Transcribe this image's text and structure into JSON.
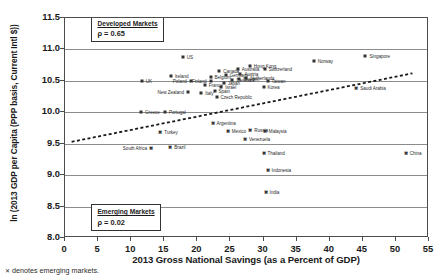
{
  "chart_data": {
    "type": "scatter",
    "title": "",
    "xlabel": "2013 Gross National Savings (as a Percent of GDP)",
    "ylabel": "ln (2013 GDP per Capita (PPP basis, Current Intl $))",
    "xlim": [
      0,
      55
    ],
    "ylim": [
      8.0,
      11.5
    ],
    "xticks": [
      "0",
      "5",
      "10",
      "15",
      "20",
      "25",
      "30",
      "35",
      "40",
      "45",
      "50",
      "55"
    ],
    "yticks": [
      "8.0",
      "8.5",
      "9.0",
      "9.5",
      "10.0",
      "10.5",
      "11.0",
      "11.5"
    ],
    "grid": "horizontal",
    "legend_position": "none",
    "trendline": {
      "style": "dashed",
      "x0": 1.0,
      "y0": 9.53,
      "x1": 52.5,
      "y1": 10.62
    },
    "annotations": [
      {
        "name": "developed-markets",
        "title": "Developed Markets",
        "rho": "ρ = 0.65",
        "x": 4.0,
        "y": 11.44
      },
      {
        "name": "emerging-markets",
        "title": "Emerging Markets",
        "rho": "ρ = 0.02",
        "x": 4.0,
        "y": 8.44
      }
    ],
    "series": [
      {
        "name": "Developed Markets",
        "marker": "square-small",
        "points": [
          {
            "label": "US",
            "x": 17.8,
            "y": 10.88,
            "lpos": "right"
          },
          {
            "label": "Ireland",
            "x": 16.0,
            "y": 10.57,
            "lpos": "right"
          },
          {
            "label": "UK",
            "x": 11.6,
            "y": 10.5,
            "lpos": "right"
          },
          {
            "label": "Poland",
            "x": 19.0,
            "y": 10.49,
            "lpos": "left"
          },
          {
            "label": "New Zealand",
            "x": 18.6,
            "y": 10.33,
            "lpos": "left"
          },
          {
            "label": "Greece",
            "x": 11.5,
            "y": 10.01,
            "lpos": "right"
          },
          {
            "label": "Portugal",
            "x": 15.1,
            "y": 10.0,
            "lpos": "right"
          },
          {
            "label": "Italy",
            "x": 20.6,
            "y": 10.31,
            "lpos": "right"
          },
          {
            "label": "Spain",
            "x": 22.6,
            "y": 10.34,
            "lpos": "right"
          },
          {
            "label": "France",
            "x": 21.1,
            "y": 10.44,
            "lpos": "right"
          },
          {
            "label": "Belgium",
            "x": 22.0,
            "y": 10.56,
            "lpos": "right"
          },
          {
            "label": "Canada",
            "x": 23.3,
            "y": 10.66,
            "lpos": "right"
          },
          {
            "label": "Germany",
            "x": 24.3,
            "y": 10.59,
            "lpos": "right"
          },
          {
            "label": "Australia",
            "x": 26.1,
            "y": 10.69,
            "lpos": "right"
          },
          {
            "label": "Austria",
            "x": 26.5,
            "y": 10.61,
            "lpos": "right"
          },
          {
            "label": "Israel",
            "x": 23.6,
            "y": 10.4,
            "lpos": "right"
          },
          {
            "label": "Japan",
            "x": 24.0,
            "y": 10.46,
            "lpos": "right"
          },
          {
            "label": "Denmark",
            "x": 25.3,
            "y": 10.51,
            "lpos": "right"
          },
          {
            "label": "Sweden",
            "x": 26.3,
            "y": 10.53,
            "lpos": "right"
          },
          {
            "label": "Netherlands",
            "x": 27.4,
            "y": 10.55,
            "lpos": "right"
          },
          {
            "label": "Finland",
            "x": 22.0,
            "y": 10.5,
            "lpos": "left"
          },
          {
            "label": "Czech Republic",
            "x": 22.9,
            "y": 10.24,
            "lpos": "right"
          },
          {
            "label": "Taiwan",
            "x": 30.6,
            "y": 10.49,
            "lpos": "right"
          },
          {
            "label": "Korea",
            "x": 30.0,
            "y": 10.41,
            "lpos": "right"
          },
          {
            "label": "Hong Kong",
            "x": 27.9,
            "y": 10.74,
            "lpos": "right"
          },
          {
            "label": "Switzerland",
            "x": 30.2,
            "y": 10.69,
            "lpos": "right"
          },
          {
            "label": "Norway",
            "x": 37.6,
            "y": 10.82,
            "lpos": "right"
          },
          {
            "label": "Singapore",
            "x": 45.4,
            "y": 10.9,
            "lpos": "right"
          }
        ]
      },
      {
        "name": "Emerging Markets",
        "marker": "x-cross",
        "points": [
          {
            "label": "Turkey",
            "x": 14.4,
            "y": 9.69,
            "lpos": "right"
          },
          {
            "label": "Argentina",
            "x": 22.3,
            "y": 9.83,
            "lpos": "right"
          },
          {
            "label": "Mexico",
            "x": 24.6,
            "y": 9.7,
            "lpos": "right"
          },
          {
            "label": "South Africa",
            "x": 13.0,
            "y": 9.43,
            "lpos": "left"
          },
          {
            "label": "Brazil",
            "x": 15.9,
            "y": 9.44,
            "lpos": "right"
          },
          {
            "label": "Russia",
            "x": 28.0,
            "y": 9.72,
            "lpos": "right"
          },
          {
            "label": "Malaysia",
            "x": 30.2,
            "y": 9.7,
            "lpos": "right"
          },
          {
            "label": "Venezuela",
            "x": 27.2,
            "y": 9.58,
            "lpos": "right"
          },
          {
            "label": "Thailand",
            "x": 30.0,
            "y": 9.35,
            "lpos": "right"
          },
          {
            "label": "Saudi Arabia",
            "x": 44.0,
            "y": 10.39,
            "lpos": "right"
          },
          {
            "label": "China",
            "x": 51.5,
            "y": 9.35,
            "lpos": "right"
          },
          {
            "label": "Indonesia",
            "x": 30.6,
            "y": 9.08,
            "lpos": "right"
          },
          {
            "label": "India",
            "x": 30.3,
            "y": 8.73,
            "lpos": "right"
          }
        ]
      }
    ],
    "footnote": "denotes emerging markets.",
    "footnote_marker": "✕"
  }
}
